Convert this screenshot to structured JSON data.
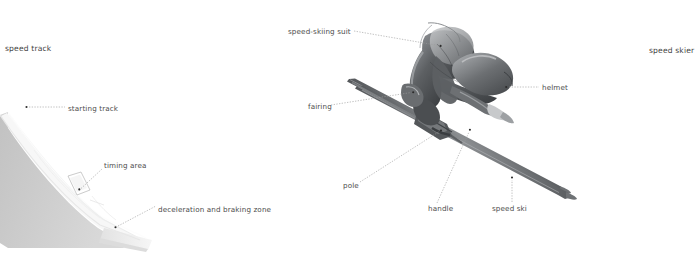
{
  "figure": {
    "title_left": "speed track",
    "title_right": "speed skier",
    "background_color": "#ffffff",
    "label_color": "#4c4c4c",
    "leader_color": "#9a9a9a"
  },
  "labels": {
    "speed_track": "speed track",
    "speed_skier": "speed skier",
    "starting_track": "starting track",
    "timing_area": "timing area",
    "deceleration_zone": "deceleration and braking zone",
    "speed_skiing_suit": "speed-skiing suit",
    "helmet": "helmet",
    "fairing": "fairing",
    "pole": "pole",
    "handle": "handle",
    "speed_ski": "speed ski"
  },
  "callouts_left": [
    {
      "id": "starting-track",
      "label": "starting track",
      "x": 68,
      "y": 109,
      "dot_x": 26,
      "dot_y": 107
    },
    {
      "id": "timing-area",
      "label": "timing area",
      "x": 104,
      "y": 166,
      "dot_x": 79,
      "dot_y": 189
    },
    {
      "id": "deceleration-and-braking-zone",
      "label": "deceleration and braking zone",
      "x": 158,
      "y": 210,
      "dot_x": 115,
      "dot_y": 227
    }
  ],
  "callouts_right": [
    {
      "id": "speed-skiing-suit",
      "label": "speed-skiing suit",
      "x": 288,
      "y": 32,
      "dot_x": 441,
      "dot_y": 46
    },
    {
      "id": "helmet",
      "label": "helmet",
      "x": 542,
      "y": 88,
      "dot_x": 506,
      "dot_y": 87
    },
    {
      "id": "fairing",
      "label": "fairing",
      "x": 308,
      "y": 107,
      "dot_x": 413,
      "dot_y": 92
    },
    {
      "id": "pole",
      "label": "pole",
      "x": 343,
      "y": 186,
      "dot_x": 441,
      "dot_y": 131
    },
    {
      "id": "handle",
      "label": "handle",
      "x": 428,
      "y": 209,
      "dot_x": 470,
      "dot_y": 130
    },
    {
      "id": "speed-ski",
      "label": "speed ski",
      "x": 497,
      "y": 209,
      "dot_x": 512,
      "dot_y": 177
    }
  ],
  "colors": {
    "ramp_top": "#f4f4f4",
    "ramp_side": "#c9c9c9",
    "ramp_front": "#e6e6e6",
    "suit_dark": "#4e5154",
    "suit_mid": "#7b7e81",
    "suit_light": "#b6b8ba",
    "ski": "#6e7174"
  }
}
